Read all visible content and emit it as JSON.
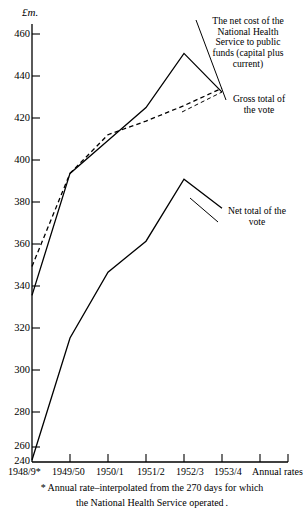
{
  "chart_data": {
    "type": "line",
    "title": "",
    "ylabel": "£m.",
    "xlabel": "Annual rates",
    "ylim": [
      240,
      465
    ],
    "yticks": [
      240,
      260,
      280,
      300,
      320,
      340,
      360,
      380,
      400,
      420,
      440,
      460
    ],
    "ytick_labels": [
      "240",
      "260",
      "280",
      "300",
      "320",
      "340",
      "360",
      "380",
      "400",
      "420",
      "440",
      "460"
    ],
    "grid": false,
    "legend_position": "inline-annotations",
    "categories": [
      "1948/9*",
      "1949/50",
      "1950/1",
      "1951/2",
      "1952/3",
      "1953/4"
    ],
    "series": [
      {
        "name": "Gross total of the vote",
        "style": "solid",
        "values": [
          325,
          388,
          405,
          422,
          450,
          430
        ]
      },
      {
        "name": "The net cost of the National Health Service to public funds (capital plus current)",
        "style": "dashed",
        "values": [
          340,
          388,
          408,
          415,
          423,
          432
        ]
      },
      {
        "name": "Net total of the vote",
        "style": "solid",
        "values": [
          240,
          303,
          337,
          353,
          385,
          370
        ]
      }
    ],
    "annotations": [
      {
        "id": "net-cost-annotation",
        "text": "The net cost of the\nNational Health\nService to public\nfunds  (capital plus\ncurrent)"
      },
      {
        "id": "gross-total-annotation",
        "text": "Gross total of\nthe vote"
      },
      {
        "id": "net-total-annotation",
        "text": "Net total of the\nvote"
      }
    ]
  },
  "axis": {
    "unit_label": "£m.",
    "x_axis_caption": "Annual rates",
    "ytick_labels": [
      "460",
      "440",
      "420",
      "400",
      "380",
      "360",
      "340",
      "320",
      "300",
      "280",
      "260",
      "240"
    ],
    "xtick_labels": [
      "1948/9*",
      "1949/50",
      "1950/1",
      "1951/2",
      "1952/3",
      "1953/4"
    ]
  },
  "annotations": {
    "net_cost": {
      "line1": "The net cost of the",
      "line2": "National Health",
      "line3": "Service to public",
      "line4": "funds  (capital plus",
      "line5": "current)"
    },
    "gross_total": {
      "line1": "Gross total of",
      "line2": "the vote"
    },
    "net_total": {
      "line1": "Net total of the",
      "line2": "vote"
    }
  },
  "footnote": {
    "line1": "*  Annual rate–interpolated  from the 270 days for which",
    "line2": "the National Health Service operated ."
  }
}
